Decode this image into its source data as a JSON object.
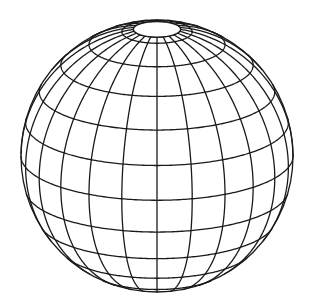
{
  "figure": {
    "type": "wireframe-globe",
    "projection": "orthographic",
    "center": [
      157,
      156
    ],
    "radius": 136,
    "tilt_deg": 19,
    "meridian_step_deg": 15,
    "parallel_step_deg": 15,
    "parallels_deg": [
      -75,
      -60,
      -45,
      -30,
      -15,
      0,
      15,
      30,
      45,
      60,
      75
    ],
    "pole_cap_lat_deg": 80,
    "line_color": "#1a1a1a",
    "background_color": "#ffffff",
    "line_width": 1.3
  }
}
